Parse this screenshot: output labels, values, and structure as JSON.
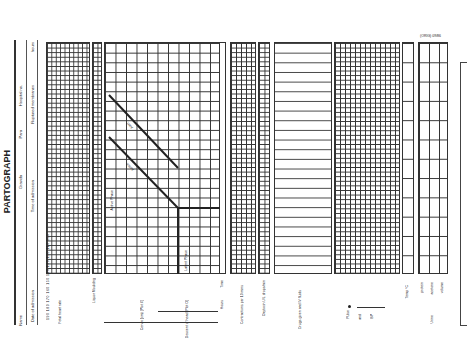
{
  "form": {
    "title": "PARTOGRAPH",
    "form_code": "(ORIG) 09/86",
    "header_fields": {
      "name": "Name",
      "gravida": "Gravida",
      "para": "Para",
      "hospital_no": "Hospital no.",
      "date_of_admission": "Date of admission",
      "time_of_admission": "Time of admission",
      "ruptured_membranes": "Ruptured membranes",
      "hours": "hours"
    },
    "sections": {
      "fetal_heart_rate": {
        "label": "Fetal heart rate",
        "ticks": [
          "190",
          "180",
          "170",
          "160",
          "150",
          "140",
          "130",
          "120",
          "110",
          "100"
        ]
      },
      "liquor_moulding": {
        "label": "Liquor Moulding"
      },
      "cervix": {
        "label": "Cervix (cm) [Plot X]",
        "ticks": [
          "10",
          "9",
          "8",
          "7",
          "6",
          "5",
          "4",
          "3",
          "2",
          "1",
          "0"
        ],
        "alert_label": "Alert",
        "action_label": "Action",
        "active_phase": "Active Phase",
        "latent_phase": "Latent Phase"
      },
      "descent": {
        "label": "Descent of head [Plot O]"
      },
      "hours_axis": {
        "label": "Hours",
        "ticks": [
          "0",
          "1",
          "2",
          "3",
          "4",
          "5",
          "6",
          "7",
          "8",
          "9",
          "10",
          "11",
          "12",
          "13",
          "14",
          "15",
          "16",
          "17",
          "18",
          "19",
          "20",
          "21",
          "22",
          "23",
          "24"
        ]
      },
      "time_label": "Time",
      "contractions": {
        "label": "Contractions per 10 mins",
        "ticks": [
          "5",
          "4",
          "3",
          "2",
          "1"
        ]
      },
      "oxytocin": {
        "label": "Oxytocin U/L drops/min"
      },
      "drugs": {
        "label": "Drugs given and IV fluids"
      },
      "pulse_bp": {
        "label_pulse": "Pulse",
        "label_and": "and",
        "label_bp": "BP",
        "ticks": [
          "180",
          "170",
          "160",
          "150",
          "140",
          "130",
          "120",
          "110",
          "100",
          "90",
          "80",
          "70",
          "60"
        ]
      },
      "temp": {
        "label": "Temp °C"
      },
      "urine": {
        "label": "Urine",
        "rows": [
          "protein",
          "acetone",
          "volume"
        ]
      }
    }
  }
}
